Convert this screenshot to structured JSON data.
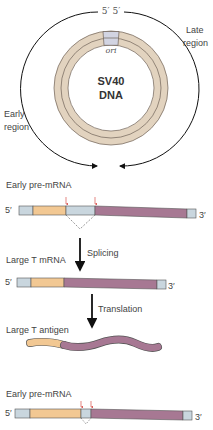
{
  "colors": {
    "ring": "#e2d3bf",
    "ring_stroke": "#6e6258",
    "ori": "#d2d4e2",
    "utr": "#c9d6de",
    "exon1": "#f2c893",
    "exon2": "#a77893",
    "intron": "#c9d6de",
    "arrow_red": "#d9534f",
    "black": "#111111"
  },
  "circle": {
    "top_label": "5′  5′",
    "ori_label": "ori",
    "center_line1": "SV40",
    "center_line2": "DNA",
    "late_region_line1": "Late",
    "late_region_line2": "region",
    "early_region_line1": "Early",
    "early_region_line2": "region"
  },
  "panel1": {
    "title": "Early pre-mRNA",
    "five_prime": "5′",
    "three_prime": "3′"
  },
  "step1": {
    "label": "Splicing"
  },
  "panel2": {
    "title": "Large T mRNA",
    "five_prime": "5′",
    "three_prime": "3′"
  },
  "step2": {
    "label": "Translation"
  },
  "panel3": {
    "title": "Large T antigen"
  },
  "panel4": {
    "title": "Early pre-mRNA",
    "five_prime": "5′",
    "three_prime": "3′"
  }
}
